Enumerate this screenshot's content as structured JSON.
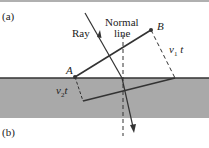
{
  "figure": {
    "panel_a_label": "(a)",
    "panel_b_label": "(b)",
    "ray_label": "Ray",
    "normal_label_line1": "Normal",
    "normal_label_line2": "line",
    "point_a": "A",
    "point_b": "B",
    "v1t_label": "v",
    "v1t_sub": "1",
    "v1t_t": "t",
    "v2t_label": "v",
    "v2t_sub": "2",
    "v2t_t": "t"
  },
  "colors": {
    "medium_fill": "#a9a9a9",
    "line": "#333333",
    "top_bar": "#b0b0b0"
  }
}
